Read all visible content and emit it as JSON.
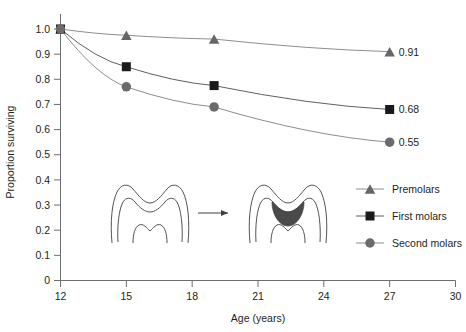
{
  "chart_data": {
    "type": "line",
    "title": "",
    "xlabel": "Age (years)",
    "ylabel": "Proportion surviving",
    "xlim": [
      12,
      30
    ],
    "ylim": [
      0,
      1.0
    ],
    "grid": false,
    "legend_position": "inside-right",
    "x_ticks": [
      "12",
      "15",
      "18",
      "21",
      "24",
      "27",
      "30"
    ],
    "x_tick_values": [
      12,
      15,
      18,
      21,
      24,
      27,
      30
    ],
    "y_ticks": [
      "0",
      "0.1",
      "0.2",
      "0.3",
      "0.4",
      "0.5",
      "0.6",
      "0.7",
      "0.8",
      "0.9",
      "1.0"
    ],
    "y_tick_values": [
      0,
      0.1,
      0.2,
      0.3,
      0.4,
      0.5,
      0.6,
      0.7,
      0.8,
      0.9,
      1.0
    ],
    "x": [
      12,
      15,
      19,
      27
    ],
    "series": [
      {
        "name": "Premolars",
        "marker": "triangle",
        "color": "#666666",
        "line_color": "#808080",
        "values": [
          1.0,
          0.975,
          0.96,
          0.91
        ],
        "end_label": "0.91"
      },
      {
        "name": "First molars",
        "marker": "square",
        "color": "#1a1a1a",
        "line_color": "#4d4d4d",
        "values": [
          1.0,
          0.85,
          0.775,
          0.68
        ],
        "end_label": "0.68"
      },
      {
        "name": "Second molars",
        "marker": "circle",
        "color": "#6b6b6b",
        "line_color": "#808080",
        "values": [
          1.0,
          0.77,
          0.69,
          0.55
        ],
        "end_label": "0.55"
      }
    ],
    "annotations": [
      {
        "name": "tooth-diagram",
        "description": "Tooth cross-section before caries, arrow, tooth cross-section with dark occlusal caries lesion"
      }
    ]
  },
  "legend": {
    "items": [
      {
        "label": "Premolars",
        "marker": "triangle"
      },
      {
        "label": "First molars",
        "marker": "square"
      },
      {
        "label": "Second molars",
        "marker": "circle"
      }
    ]
  },
  "icons": {
    "arrow": "arrow-right-icon",
    "tooth_before": "tooth-outline-icon",
    "tooth_after": "tooth-caries-icon"
  }
}
